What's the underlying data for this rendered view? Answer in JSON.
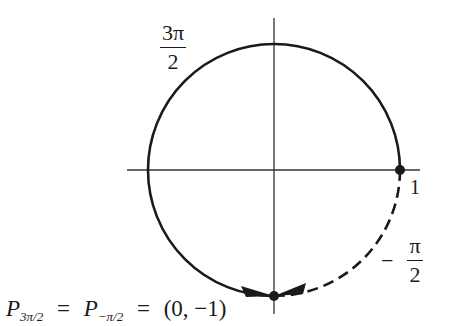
{
  "diagram": {
    "type": "unit-circle",
    "colors": {
      "stroke": "#1a1a1a",
      "background": "#ffffff"
    },
    "labels": {
      "top_left_angle": {
        "numerator": "3π",
        "denominator": "2"
      },
      "right_point": "1",
      "neg_angle": {
        "sign": "−",
        "numerator": "π",
        "denominator": "2"
      },
      "equation": {
        "p1": "P",
        "p1_sub": "3π/2",
        "eq1": "=",
        "p2": "P",
        "p2_sub": "−π/2",
        "eq2": "=",
        "coords": "(0, −1)"
      }
    },
    "points": [
      {
        "name": "(1, 0)",
        "description": "start point on positive x-axis"
      },
      {
        "name": "(0, −1)",
        "description": "terminal point at bottom"
      }
    ],
    "arcs": [
      {
        "style": "solid",
        "from": "(1,0)",
        "to": "(0,-1)",
        "direction": "counterclockwise",
        "angle": "3π/2"
      },
      {
        "style": "dashed",
        "from": "(1,0)",
        "to": "(0,-1)",
        "direction": "clockwise",
        "angle": "−π/2"
      }
    ]
  }
}
